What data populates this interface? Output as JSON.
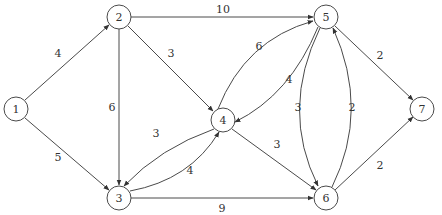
{
  "graph": {
    "type": "directed-weighted",
    "nodes": [
      {
        "id": "1",
        "label": "1",
        "x": 16,
        "y": 109
      },
      {
        "id": "2",
        "label": "2",
        "x": 119,
        "y": 17
      },
      {
        "id": "3",
        "label": "3",
        "x": 119,
        "y": 198
      },
      {
        "id": "4",
        "label": "4",
        "x": 223,
        "y": 120
      },
      {
        "id": "5",
        "label": "5",
        "x": 326,
        "y": 17
      },
      {
        "id": "6",
        "label": "6",
        "x": 326,
        "y": 198
      },
      {
        "id": "7",
        "label": "7",
        "x": 422,
        "y": 109
      }
    ],
    "edges": [
      {
        "from": "1",
        "to": "2",
        "weight": "4"
      },
      {
        "from": "1",
        "to": "3",
        "weight": "5"
      },
      {
        "from": "2",
        "to": "5",
        "weight": "10"
      },
      {
        "from": "2",
        "to": "4",
        "weight": "3"
      },
      {
        "from": "2",
        "to": "3",
        "weight": "6"
      },
      {
        "from": "4",
        "to": "3",
        "weight": "3"
      },
      {
        "from": "3",
        "to": "4",
        "weight": "4"
      },
      {
        "from": "4",
        "to": "5",
        "weight": "6"
      },
      {
        "from": "5",
        "to": "4",
        "weight": "4"
      },
      {
        "from": "4",
        "to": "6",
        "weight": "3"
      },
      {
        "from": "3",
        "to": "6",
        "weight": "9"
      },
      {
        "from": "5",
        "to": "6",
        "weight": "3"
      },
      {
        "from": "6",
        "to": "5",
        "weight": "2"
      },
      {
        "from": "5",
        "to": "7",
        "weight": "2"
      },
      {
        "from": "6",
        "to": "7",
        "weight": "2"
      }
    ]
  }
}
